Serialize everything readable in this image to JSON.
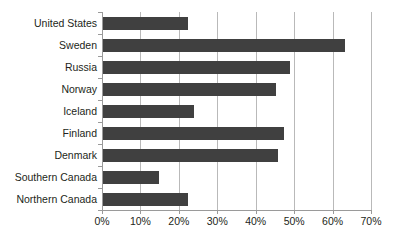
{
  "chart_data": {
    "type": "bar",
    "orientation": "horizontal",
    "title": "",
    "subtitle": "",
    "xlabel": "",
    "ylabel": "",
    "categories": [
      "United States",
      "Sweden",
      "Russia",
      "Norway",
      "Iceland",
      "Finland",
      "Denmark",
      "Southern Canada",
      "Northern Canada"
    ],
    "values": [
      22.5,
      63.2,
      48.8,
      45.2,
      24.0,
      47.3,
      45.7,
      14.9,
      22.5
    ],
    "value_suffix": "%",
    "xlim": [
      0,
      70
    ],
    "xtick_values": [
      0,
      10,
      20,
      30,
      40,
      50,
      60,
      70
    ],
    "xtick_labels": [
      "0%",
      "10%",
      "20%",
      "30%",
      "40%",
      "50%",
      "60%",
      "70%"
    ],
    "grid": "vertical",
    "legend": "none",
    "bar_color": "#404040",
    "gridline_color": "#b9b9b9",
    "axis_color": "#9a9a9a",
    "background_color": "#ffffff",
    "text_color": "#231f20"
  }
}
